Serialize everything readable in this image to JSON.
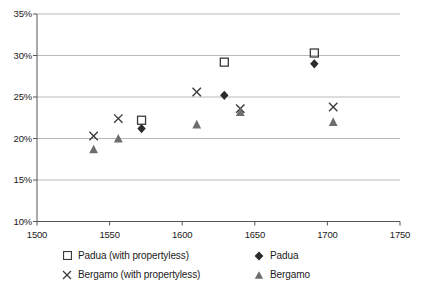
{
  "chart_data": {
    "type": "scatter",
    "title": "",
    "xlabel": "",
    "ylabel": "",
    "xlim": [
      1500,
      1750
    ],
    "ylim": [
      10,
      35
    ],
    "xticks": [
      1500,
      1550,
      1600,
      1650,
      1700,
      1750
    ],
    "xtick_labels": [
      "1500",
      "1550",
      "1600",
      "1650",
      "1700",
      "1750"
    ],
    "yticks": [
      10,
      15,
      20,
      25,
      30,
      35
    ],
    "ytick_labels": [
      "10%",
      "15%",
      "20%",
      "25%",
      "30%",
      "35%"
    ],
    "grid": "horizontal",
    "legend_position": "bottom",
    "series": [
      {
        "name": "Padua (with propertyless)",
        "marker": "open-square",
        "color": "#3b3b3b",
        "points": [
          {
            "x": 1572,
            "y": 22.2
          },
          {
            "x": 1629,
            "y": 29.2
          },
          {
            "x": 1691,
            "y": 30.3
          }
        ]
      },
      {
        "name": "Padua",
        "marker": "filled-diamond",
        "color": "#2b2b2b",
        "points": [
          {
            "x": 1572,
            "y": 21.2
          },
          {
            "x": 1629,
            "y": 25.2
          },
          {
            "x": 1691,
            "y": 29.0
          }
        ]
      },
      {
        "name": "Bergamo (with propertyless)",
        "marker": "cross-x",
        "color": "#3b3b3b",
        "points": [
          {
            "x": 1539,
            "y": 20.3
          },
          {
            "x": 1556,
            "y": 22.4
          },
          {
            "x": 1610,
            "y": 25.6
          },
          {
            "x": 1640,
            "y": 23.6
          },
          {
            "x": 1704,
            "y": 23.8
          }
        ]
      },
      {
        "name": "Bergamo",
        "marker": "filled-triangle",
        "color": "#6e6e6e",
        "points": [
          {
            "x": 1539,
            "y": 18.7
          },
          {
            "x": 1556,
            "y": 20.0
          },
          {
            "x": 1610,
            "y": 21.7
          },
          {
            "x": 1640,
            "y": 23.2
          },
          {
            "x": 1704,
            "y": 22.0
          }
        ]
      }
    ]
  },
  "legend": {
    "rows": [
      [
        {
          "label": "Padua (with propertyless)",
          "marker": "open-square"
        },
        {
          "label": "Padua",
          "marker": "filled-diamond"
        }
      ],
      [
        {
          "label": "Bergamo (with propertyless)",
          "marker": "cross-x"
        },
        {
          "label": "Bergamo",
          "marker": "filled-triangle"
        }
      ]
    ]
  },
  "colors": {
    "axis": "#555555",
    "grid": "#b9b9b9",
    "text": "#1a1a1a",
    "open_marker": "#3b3b3b",
    "filled_dark": "#2b2b2b",
    "filled_gray": "#6e6e6e"
  }
}
